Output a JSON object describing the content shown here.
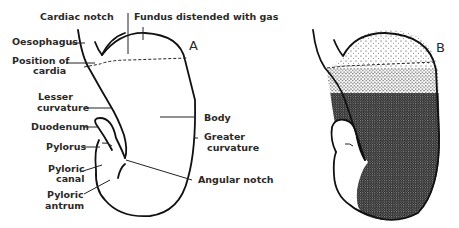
{
  "figure": {
    "panels": [
      {
        "id": "A",
        "label": "A"
      },
      {
        "id": "B",
        "label": "B"
      }
    ],
    "labels": {
      "cardiac_notch": "Cardiac notch",
      "fundus": "Fundus distended with gas",
      "oesophagus": "Oesophagus",
      "position_of_cardia_1": "Position of",
      "position_of_cardia_2": "cardia",
      "lesser_curvature_1": "Lesser",
      "lesser_curvature_2": "curvature",
      "duodenum": "Duodenum",
      "pylorus": "Pylorus",
      "pyloric_canal_1": "Pyloric",
      "pyloric_canal_2": "canal",
      "pyloric_antrum_1": "Pyloric",
      "pyloric_antrum_2": "antrum",
      "body": "Body",
      "greater_curvature_1": "Greater",
      "greater_curvature_2": "curvature",
      "angular_notch": "Angular  notch"
    },
    "colors": {
      "line": "#111111",
      "text": "#2a2a2a",
      "stipple": "#1a1a1a"
    }
  }
}
